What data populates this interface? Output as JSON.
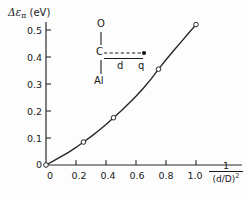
{
  "chart_data": {
    "type": "line",
    "title": "",
    "subtitle": "",
    "ylabel_text": "Δε",
    "ylabel_sub": "π",
    "ylabel_unit": "(eV)",
    "xlabel_numerator": "1",
    "xlabel_denominator": "(d/D)",
    "xlabel_exponent": "2",
    "xlim": [
      0,
      1.12
    ],
    "ylim": [
      0,
      0.56
    ],
    "grid": false,
    "legend": "none",
    "x_ticks": [
      "0",
      "0.2",
      "0.4",
      "0.6",
      "0.8",
      "1.0"
    ],
    "x_tick_values": [
      0,
      0.2,
      0.4,
      0.6,
      0.8,
      1.0
    ],
    "y_ticks": [
      "0",
      "0.1",
      "0.2",
      "0.3",
      "0.4",
      "0.5"
    ],
    "y_tick_values": [
      0,
      0.1,
      0.2,
      0.3,
      0.4,
      0.5
    ],
    "series": [
      {
        "name": "Δεπ vs 1/(d/D)^2",
        "marker": "open-circle",
        "x": [
          0.0,
          0.25,
          0.45,
          0.75,
          1.0
        ],
        "y": [
          0.0,
          0.085,
          0.175,
          0.355,
          0.52
        ]
      }
    ],
    "curve_x": [
      0.0,
      0.05,
      0.1,
      0.15,
      0.2,
      0.25,
      0.3,
      0.35,
      0.4,
      0.45,
      0.5,
      0.55,
      0.6,
      0.65,
      0.7,
      0.75,
      0.8,
      0.85,
      0.9,
      0.95,
      1.0
    ],
    "curve_y": [
      0.0,
      0.015,
      0.031,
      0.047,
      0.065,
      0.085,
      0.105,
      0.127,
      0.15,
      0.175,
      0.2,
      0.227,
      0.255,
      0.285,
      0.318,
      0.355,
      0.39,
      0.423,
      0.455,
      0.488,
      0.52
    ]
  },
  "inset": {
    "atom_top": "O",
    "atom_mid": "C",
    "atom_bottom": "Al",
    "distance_label": "d",
    "charge_label": "q"
  },
  "colors": {
    "ink": "#1a1a1a",
    "axis": "#2b2b2b",
    "curve": "#262626",
    "marker_fill": "#ffffff",
    "background": "#fdfdfd"
  }
}
